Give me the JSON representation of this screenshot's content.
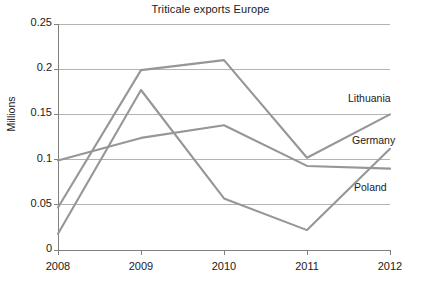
{
  "chart_data": {
    "type": "line",
    "title": "Triticale exports Europe",
    "xlabel": "",
    "ylabel": "Millions",
    "categories": [
      "2008",
      "2009",
      "2010",
      "2011",
      "2012"
    ],
    "x": [
      2008,
      2009,
      2010,
      2011,
      2012
    ],
    "ylim": [
      0,
      0.25
    ],
    "yticks": [
      "0",
      "0.05",
      "0.1",
      "0.15",
      "0.2",
      "0.25"
    ],
    "ytick_values": [
      0,
      0.05,
      0.1,
      0.15,
      0.2,
      0.25
    ],
    "grid": "horizontal",
    "legend_position": "right-inline-labels",
    "line_color": "#969696",
    "axis_color": "#808080",
    "series": [
      {
        "name": "Lithuania",
        "values": [
          0.047,
          0.199,
          0.21,
          0.102,
          0.15
        ],
        "color": "#969696"
      },
      {
        "name": "Germany",
        "values": [
          0.099,
          0.124,
          0.138,
          0.093,
          0.09
        ],
        "color": "#969696"
      },
      {
        "name": "Poland",
        "values": [
          0.018,
          0.177,
          0.057,
          0.022,
          0.112
        ],
        "color": "#969696"
      }
    ]
  },
  "labels": {
    "lithuania": "Lithuania",
    "germany": "Germany",
    "poland": "Poland"
  }
}
